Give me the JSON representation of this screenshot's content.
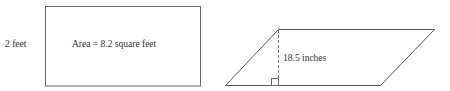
{
  "figures": {
    "rectangle": {
      "side_label": "2 feet",
      "area_label": "Area = 8.2 square feet"
    },
    "parallelogram": {
      "height_label": "18.5 inches"
    }
  },
  "colors": {
    "stroke": "#555555",
    "text": "#333333",
    "background": "#ffffff"
  }
}
